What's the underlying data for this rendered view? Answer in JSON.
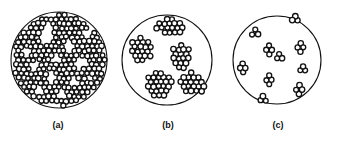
{
  "figure": {
    "background_color": "#ffffff",
    "outline_color": "#111111",
    "particle_fill": "#ffffff",
    "particle_stroke": "#111111",
    "width": 337,
    "height": 145
  },
  "panels": [
    {
      "id": "a",
      "label": "(a)",
      "description": "Dense uniform dispersion of individual particles filling the circular field with small white voids",
      "circle": {
        "cx": 57,
        "cy": 60,
        "r": 48
      },
      "particle_radius": 2.5,
      "state": "well-dispersed",
      "cluster_count": 0,
      "approx_particle_count": 560
    },
    {
      "id": "b",
      "label": "(b)",
      "description": "Five large agglomerates of many particles distributed inside an empty circular field",
      "circle": {
        "cx": 55,
        "cy": 60,
        "r": 45
      },
      "particle_radius": 2.6,
      "state": "large-agglomerates",
      "cluster_count": 5,
      "approx_particle_count": 185
    },
    {
      "id": "c",
      "label": "(c)",
      "description": "Ten small clusters of a few particles each scattered inside an empty circular field",
      "circle": {
        "cx": 55,
        "cy": 60,
        "r": 44
      },
      "particle_radius": 2.6,
      "state": "small-clusters",
      "cluster_count": 10,
      "approx_particle_count": 48
    }
  ],
  "chart_data": {
    "type": "diagram",
    "panel_ids": [
      "a",
      "b",
      "c"
    ],
    "panel_labels": [
      "(a)",
      "(b)",
      "(c)"
    ],
    "cluster_counts": [
      0,
      5,
      10
    ],
    "particle_counts": [
      560,
      185,
      48
    ],
    "states": [
      "well-dispersed",
      "large-agglomerates",
      "small-clusters"
    ]
  }
}
